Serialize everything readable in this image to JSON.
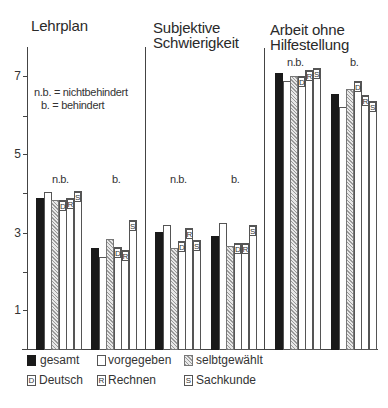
{
  "chart_data": {
    "type": "bar",
    "title": "",
    "ylabel": "",
    "xlabel": "",
    "ylim": [
      0,
      7.5
    ],
    "yticks": [
      1,
      2,
      3,
      4,
      5,
      6,
      7
    ],
    "ytick_labels": [
      "1",
      "",
      "3",
      "",
      "5",
      "",
      "7"
    ],
    "grid": false,
    "legend_position": "bottom",
    "panels": [
      {
        "title_lines": [
          "Lehrplan"
        ],
        "groups": [
          "n.b.",
          "b."
        ],
        "series": [
          {
            "name": "gesamt",
            "values": [
              3.87,
              2.59
            ]
          },
          {
            "name": "vorgegeben",
            "values": [
              4.02,
              2.38
            ]
          },
          {
            "name": "selbtgewählt",
            "values": [
              3.82,
              2.82
            ]
          },
          {
            "name": "Deutsch",
            "values": [
              3.82,
              2.62
            ]
          },
          {
            "name": "Rechnen",
            "values": [
              3.87,
              2.56
            ]
          },
          {
            "name": "Sachkunde",
            "values": [
              4.05,
              3.31
            ]
          }
        ]
      },
      {
        "title_lines": [
          "Subjektive",
          "Schwierigkeit"
        ],
        "groups": [
          "n.b.",
          "b."
        ],
        "series": [
          {
            "name": "gesamt",
            "values": [
              3.0,
              2.9
            ]
          },
          {
            "name": "vorgegeben",
            "values": [
              3.2,
              3.25
            ]
          },
          {
            "name": "selbtgewählt",
            "values": [
              2.6,
              2.65
            ]
          },
          {
            "name": "Deutsch",
            "values": [
              2.77,
              2.74
            ]
          },
          {
            "name": "Rechnen",
            "values": [
              3.1,
              2.72
            ]
          },
          {
            "name": "Sachkunde",
            "values": [
              2.8,
              3.18
            ]
          }
        ]
      },
      {
        "title_lines": [
          "Arbeit ohne",
          "Hilfestellung"
        ],
        "groups": [
          "n.b.",
          "b."
        ],
        "series": [
          {
            "name": "gesamt",
            "values": [
              7.07,
              6.54
            ]
          },
          {
            "name": "vorgegeben",
            "values": [
              6.87,
              6.2
            ]
          },
          {
            "name": "selbtgewählt",
            "values": [
              7.0,
              6.67
            ]
          },
          {
            "name": "Deutsch",
            "values": [
              7.0,
              6.85
            ]
          },
          {
            "name": "Rechnen",
            "values": [
              7.15,
              6.5
            ]
          },
          {
            "name": "Sachkunde",
            "values": [
              7.2,
              6.36
            ]
          }
        ]
      }
    ],
    "annotations": [
      "n.b. = nichtbehindert",
      "b. = behindert"
    ]
  },
  "panels": [
    {
      "title1": "Lehrplan",
      "title2": ""
    },
    {
      "title1": "Subjektive",
      "title2": "Schwierigkeit"
    },
    {
      "title1": "Arbeit ohne",
      "title2": "Hilfestellung"
    }
  ],
  "groups": {
    "nb": "n.b.",
    "b": "b."
  },
  "axis": {
    "t1": "1",
    "t3": "3",
    "t5": "5",
    "t7": "7"
  },
  "notes": {
    "line1": "n.b. = nichtbehindert",
    "line2": "b. = behindert"
  },
  "bar_labels": {
    "D": "D",
    "R": "R",
    "S": "S"
  },
  "legend": {
    "gesamt": "gesamt",
    "vorgegeben": "vorgegeben",
    "selbst": "selbtgewählt",
    "deutsch": "Deutsch",
    "rechnen": "Rechnen",
    "sachkunde": "Sachkunde",
    "deutsch_key": "D",
    "rechnen_key": "R",
    "sachkunde_key": "S"
  },
  "colors": {
    "gesamt": "#1a1a1a",
    "vorgegeben": "#ffffff",
    "selbst_hatch": "#9a9a9a",
    "axis": "#444444"
  }
}
